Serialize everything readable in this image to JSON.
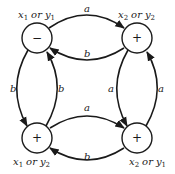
{
  "diagram": {
    "type": "state-transition-graph",
    "nodes": [
      {
        "id": "tl",
        "sign": "−",
        "label_var1": "x",
        "label_sub1": "1",
        "label_or": "or",
        "label_var2": "y",
        "label_sub2": "1"
      },
      {
        "id": "tr",
        "sign": "+",
        "label_var1": "x",
        "label_sub1": "2",
        "label_or": "or",
        "label_var2": "y",
        "label_sub2": "2"
      },
      {
        "id": "bl",
        "sign": "+",
        "label_var1": "x",
        "label_sub1": "1",
        "label_or": "or",
        "label_var2": "y",
        "label_sub2": "2"
      },
      {
        "id": "br",
        "sign": "+",
        "label_var1": "x",
        "label_sub1": "2",
        "label_or": "or",
        "label_var2": "y",
        "label_sub2": "1"
      }
    ],
    "edges": [
      {
        "from": "tl",
        "to": "tr",
        "label": "a"
      },
      {
        "from": "tr",
        "to": "tl",
        "label": "b"
      },
      {
        "from": "tl",
        "to": "bl",
        "label": "b"
      },
      {
        "from": "bl",
        "to": "tl",
        "label": "b"
      },
      {
        "from": "tr",
        "to": "br",
        "label": "a"
      },
      {
        "from": "br",
        "to": "tr",
        "label": "a"
      },
      {
        "from": "bl",
        "to": "br",
        "label": "a"
      },
      {
        "from": "br",
        "to": "bl",
        "label": "b"
      }
    ]
  }
}
